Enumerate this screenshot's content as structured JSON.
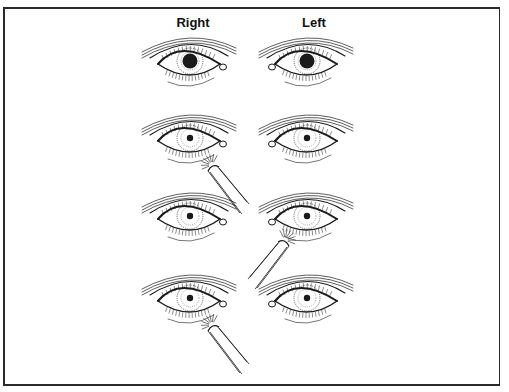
{
  "diagram": {
    "column_labels": {
      "right": "Right",
      "left": "Left"
    },
    "rows": [
      {
        "step": 1,
        "light_on": "none",
        "pupils": {
          "right": "dilated",
          "left": "dilated"
        }
      },
      {
        "step": 2,
        "light_on": "right",
        "pupils": {
          "right": "constricted",
          "left": "constricted"
        }
      },
      {
        "step": 3,
        "light_on": "left",
        "pupils": {
          "right": "constricted",
          "left": "constricted"
        }
      },
      {
        "step": 4,
        "light_on": "right",
        "pupils": {
          "right": "constricted",
          "left": "constricted"
        }
      }
    ],
    "colors": {
      "line": "#1a1a1a",
      "background": "#ffffff"
    }
  }
}
